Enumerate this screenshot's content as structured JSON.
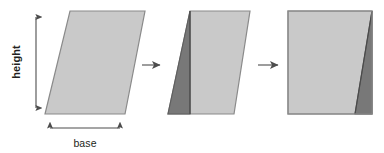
{
  "figure": {
    "background_color": "#ffffff",
    "labels": {
      "height": "height",
      "base": "base"
    },
    "colors": {
      "light_fill": "#c9c9c9",
      "dark_fill": "#787878",
      "outline": "#8a8a8a",
      "dark_outline": "#5e5e5e",
      "arrow": "#4d4d4d",
      "text": "#231f20"
    },
    "dimension_arrows": [
      {
        "name": "height-dimension-arrow",
        "orientation": "vertical",
        "label": "height",
        "x": 36,
        "y1": 11,
        "y2": 114
      },
      {
        "name": "base-dimension-arrow",
        "orientation": "horizontal",
        "label": "base",
        "y": 128,
        "x1": 45,
        "x2": 125
      }
    ],
    "step_arrows": [
      {
        "name": "transform-arrow-1",
        "x1": 142,
        "x2": 163,
        "y": 65
      },
      {
        "name": "transform-arrow-2",
        "x1": 258,
        "x2": 281,
        "y": 65
      }
    ],
    "shapes": [
      {
        "name": "parallelogram-original",
        "type": "parallelogram",
        "points": "70,11 145,11 125,114 45,114",
        "fill": "light",
        "parts": []
      },
      {
        "name": "parallelogram-cut",
        "type": "parallelogram",
        "points": "190,11 250,11 234,114 168,114",
        "fill": "light",
        "parts": [
          {
            "name": "cut-triangle-left",
            "points": "190,11 190,114 168,114",
            "fill": "dark"
          }
        ]
      },
      {
        "name": "rectangle-rearranged",
        "type": "rectangle",
        "points": "288,11 372,11 372,114 288,114",
        "fill": "light",
        "parts": [
          {
            "name": "moved-triangle-right",
            "points": "372,11 372,114 355,114",
            "fill": "dark"
          }
        ]
      }
    ]
  }
}
